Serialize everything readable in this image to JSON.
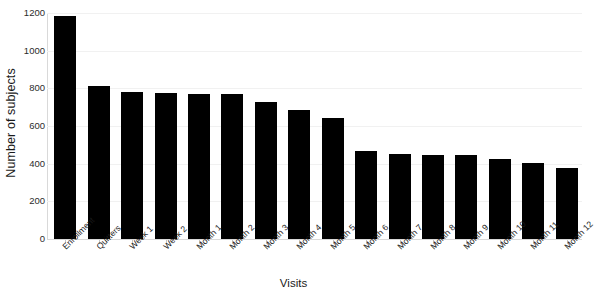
{
  "chart_data": {
    "type": "bar",
    "title": "",
    "xlabel": "Visits",
    "ylabel": "Number of subjects",
    "categories": [
      "Enrollment",
      "Quitters",
      "Week 1",
      "Week 2",
      "Month 1",
      "Month 2",
      "Month 3",
      "Month 4",
      "Month 5",
      "Month 6",
      "Month 7",
      "Month 8",
      "Month 9",
      "Month 10",
      "Month 11",
      "Month 12"
    ],
    "values": [
      1185,
      812,
      783,
      774,
      771,
      768,
      726,
      685,
      640,
      466,
      452,
      447,
      444,
      425,
      404,
      377
    ],
    "ylim": [
      0,
      1200
    ],
    "yticks": [
      0,
      200,
      400,
      600,
      800,
      1000,
      1200
    ],
    "ytick_labels": [
      "0",
      "200",
      "400",
      "600",
      "800",
      "1000",
      "1200"
    ],
    "grid": true,
    "grid_axis": "y",
    "legend": "none",
    "bar_color": "#000000",
    "grid_color": "#f1f1f1",
    "axis_color": "#d9d9d9",
    "text_color": "#1a1a1a"
  }
}
